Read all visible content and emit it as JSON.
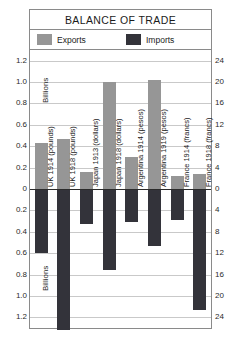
{
  "chart_data": {
    "type": "bar",
    "title": "BALANCE OF TRADE",
    "xlabel": "",
    "ylabel": "Billions",
    "ylabel_secondary": "Billions",
    "grid": true,
    "legend_position": "top",
    "orientation": "vertical-diverging",
    "categories": [
      "UK 1914 (pounds)",
      "UK 1918 (pounds)",
      "Japan 1913 (dollars)",
      "Japan 1918 (dollars)",
      "Argentina 1914 (pesos)",
      "Argentina 1919 (pesos)",
      "France 1914 (francs)",
      "France 1918 (francs)"
    ],
    "series": [
      {
        "name": "Exports",
        "color": "#969696",
        "values": [
          0.43,
          0.47,
          0.16,
          1.0,
          0.3,
          1.02,
          0.12,
          0.14
        ]
      },
      {
        "name": "Imports",
        "color": "#33333a",
        "values": [
          -0.6,
          -1.32,
          -0.33,
          -0.76,
          -0.31,
          -0.53,
          -0.29,
          -1.13
        ]
      }
    ],
    "axis_left": {
      "label": "Billions",
      "ticks": [
        "1.2",
        "1.0",
        "0.8",
        "0.6",
        "0.4",
        "0.2",
        "0",
        "0.2",
        "0.4",
        "0.6",
        "0.8",
        "1.0",
        "1.2"
      ],
      "values": [
        1.2,
        1.0,
        0.8,
        0.6,
        0.4,
        0.2,
        0,
        -0.2,
        -0.4,
        -0.6,
        -0.8,
        -1.0,
        -1.2
      ],
      "ylim": [
        -1.3,
        1.3
      ]
    },
    "axis_right": {
      "label": "Billions",
      "ticks": [
        "24",
        "20",
        "16",
        "12",
        "8",
        "4",
        "0",
        "4",
        "8",
        "12",
        "16",
        "20",
        "24"
      ],
      "values": [
        24,
        20,
        16,
        12,
        8,
        4,
        0,
        -4,
        -8,
        -12,
        -16,
        -20,
        -24
      ],
      "ylim": [
        -26,
        26
      ]
    },
    "legend": [
      {
        "label": "Exports",
        "color": "#969696"
      },
      {
        "label": "Imports",
        "color": "#33333a"
      }
    ],
    "colors": {
      "exports": "#969696",
      "imports": "#33333a",
      "grid": "#c9c9c9",
      "zero_line": "#2b2b2b",
      "frame": "#8a8a8a",
      "text": "#1b1b1b",
      "background": "#ffffff"
    }
  }
}
